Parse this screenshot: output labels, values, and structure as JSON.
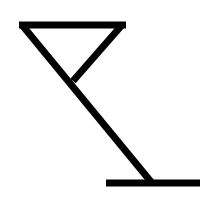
{
  "figure": {
    "title": "Martini glass symbol",
    "icon": "martini-glass-icon",
    "stroke_color": "#000000",
    "background_color": "#ffffff",
    "stroke_width": 7,
    "shapes": {
      "rim": {
        "x1": 19,
        "y1": 25,
        "x2": 126,
        "y2": 25
      },
      "left_side_and_stem": {
        "x1": 22,
        "y1": 25,
        "x2": 152,
        "y2": 183
      },
      "right_side": {
        "x1": 122,
        "y1": 25,
        "x2": 73,
        "y2": 81
      },
      "base": {
        "x1": 106,
        "y1": 183,
        "x2": 200,
        "y2": 183
      }
    }
  }
}
